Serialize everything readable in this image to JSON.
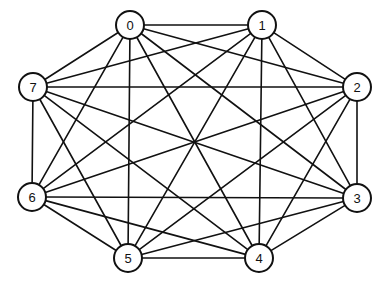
{
  "figure": {
    "background_color": "#ffffff",
    "line_color": "#111111",
    "node_fill_color": "#ffffff",
    "node_stroke_color": "#111111",
    "width": 388,
    "height": 288
  },
  "graph": {
    "type": "complete-graph",
    "node_count": 8,
    "edge_count": 28,
    "node_radius": 14,
    "nodes": [
      {
        "id": "0",
        "label": "0",
        "x": 130,
        "y": 25
      },
      {
        "id": "1",
        "label": "1",
        "x": 262,
        "y": 25
      },
      {
        "id": "2",
        "label": "2",
        "x": 357,
        "y": 87
      },
      {
        "id": "3",
        "label": "3",
        "x": 357,
        "y": 198
      },
      {
        "id": "4",
        "label": "4",
        "x": 259,
        "y": 258
      },
      {
        "id": "5",
        "label": "5",
        "x": 128,
        "y": 258
      },
      {
        "id": "6",
        "label": "6",
        "x": 32,
        "y": 197
      },
      {
        "id": "7",
        "label": "7",
        "x": 33,
        "y": 87
      }
    ],
    "edges": [
      {
        "from": "0",
        "to": "1"
      },
      {
        "from": "0",
        "to": "2"
      },
      {
        "from": "0",
        "to": "3"
      },
      {
        "from": "0",
        "to": "4"
      },
      {
        "from": "0",
        "to": "5"
      },
      {
        "from": "0",
        "to": "6"
      },
      {
        "from": "0",
        "to": "7"
      },
      {
        "from": "1",
        "to": "2"
      },
      {
        "from": "1",
        "to": "3"
      },
      {
        "from": "1",
        "to": "4"
      },
      {
        "from": "1",
        "to": "5"
      },
      {
        "from": "1",
        "to": "6"
      },
      {
        "from": "1",
        "to": "7"
      },
      {
        "from": "2",
        "to": "3"
      },
      {
        "from": "2",
        "to": "4"
      },
      {
        "from": "2",
        "to": "5"
      },
      {
        "from": "2",
        "to": "6"
      },
      {
        "from": "2",
        "to": "7"
      },
      {
        "from": "3",
        "to": "4"
      },
      {
        "from": "3",
        "to": "5"
      },
      {
        "from": "3",
        "to": "6"
      },
      {
        "from": "3",
        "to": "7"
      },
      {
        "from": "4",
        "to": "5"
      },
      {
        "from": "4",
        "to": "6"
      },
      {
        "from": "4",
        "to": "7"
      },
      {
        "from": "5",
        "to": "6"
      },
      {
        "from": "5",
        "to": "7"
      },
      {
        "from": "6",
        "to": "7"
      }
    ]
  }
}
